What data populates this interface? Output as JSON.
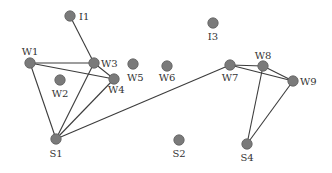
{
  "diagram": {
    "type": "network-graph",
    "colors": {
      "node": "#7a7a7a",
      "edge": "#3c3c3c",
      "label": "#333333",
      "background": "#ffffff"
    },
    "nodes": [
      {
        "id": "I1",
        "label": "I1",
        "x": 70,
        "y": 16,
        "lx": 79,
        "ly": 20,
        "anchor": "start"
      },
      {
        "id": "I3",
        "label": "I3",
        "x": 213,
        "y": 23,
        "lx": 213,
        "ly": 40,
        "anchor": "middle"
      },
      {
        "id": "W1",
        "label": "W1",
        "x": 30,
        "y": 63,
        "lx": 30,
        "ly": 55,
        "anchor": "middle"
      },
      {
        "id": "W2",
        "label": "W2",
        "x": 60,
        "y": 80,
        "lx": 60,
        "ly": 97,
        "anchor": "middle"
      },
      {
        "id": "W3",
        "label": "W3",
        "x": 94,
        "y": 63,
        "lx": 101,
        "ly": 67,
        "anchor": "start"
      },
      {
        "id": "W4",
        "label": "W4",
        "x": 114,
        "y": 79,
        "lx": 108,
        "ly": 93,
        "anchor": "start"
      },
      {
        "id": "W5",
        "label": "W5",
        "x": 133,
        "y": 64,
        "lx": 127,
        "ly": 81,
        "anchor": "start"
      },
      {
        "id": "W6",
        "label": "W6",
        "x": 167,
        "y": 66,
        "lx": 167,
        "ly": 81,
        "anchor": "middle"
      },
      {
        "id": "W7",
        "label": "W7",
        "x": 230,
        "y": 65,
        "lx": 230,
        "ly": 81,
        "anchor": "middle"
      },
      {
        "id": "W8",
        "label": "W8",
        "x": 263,
        "y": 66,
        "lx": 263,
        "ly": 59,
        "anchor": "middle"
      },
      {
        "id": "W9",
        "label": "W9",
        "x": 293,
        "y": 81,
        "lx": 300,
        "ly": 85,
        "anchor": "start"
      },
      {
        "id": "S1",
        "label": "S1",
        "x": 56,
        "y": 139,
        "lx": 56,
        "ly": 157,
        "anchor": "middle"
      },
      {
        "id": "S2",
        "label": "S2",
        "x": 179,
        "y": 140,
        "lx": 179,
        "ly": 157,
        "anchor": "middle"
      },
      {
        "id": "S4",
        "label": "S4",
        "x": 247,
        "y": 144,
        "lx": 247,
        "ly": 161,
        "anchor": "middle"
      }
    ],
    "edges": [
      [
        "I1",
        "W3"
      ],
      [
        "W1",
        "W3"
      ],
      [
        "W1",
        "W4"
      ],
      [
        "W3",
        "W4"
      ],
      [
        "W1",
        "S1"
      ],
      [
        "W3",
        "S1"
      ],
      [
        "W4",
        "S1"
      ],
      [
        "S1",
        "W7"
      ],
      [
        "W7",
        "W8"
      ],
      [
        "W7",
        "W9"
      ],
      [
        "W8",
        "W9"
      ],
      [
        "W8",
        "S4"
      ],
      [
        "W9",
        "S4"
      ]
    ]
  }
}
